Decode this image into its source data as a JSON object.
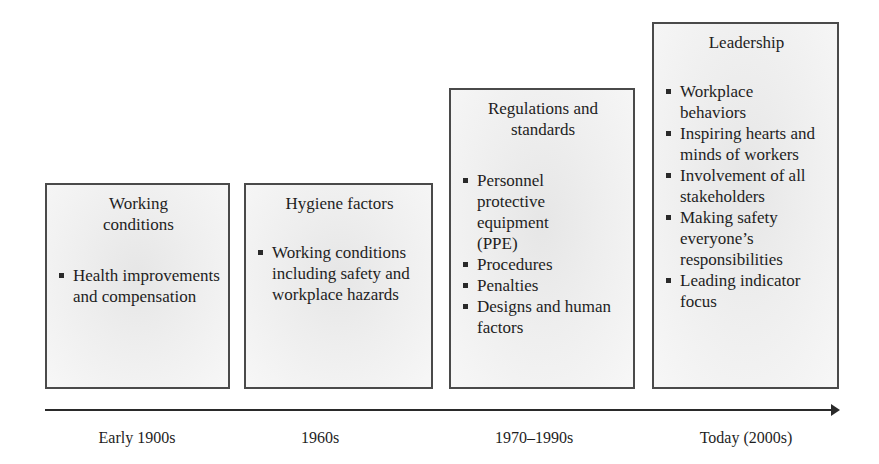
{
  "stages": [
    {
      "title": "Working conditions",
      "items": [
        "Health improvements and compensation"
      ],
      "era": "Early 1900s"
    },
    {
      "title": "Hygiene factors",
      "items": [
        "Working conditions including safety and workplace hazards"
      ],
      "era": "1960s"
    },
    {
      "title": "Regulations and standards",
      "items": [
        "Personnel protective equipment (PPE)",
        "Procedures",
        "Penalties",
        "Designs and human factors"
      ],
      "era": "1970–1990s"
    },
    {
      "title": "Leadership",
      "items": [
        "Workplace behaviors",
        "Inspiring hearts and minds of workers",
        "Involvement of all stakeholders",
        "Making safety everyone’s responsibilities",
        "Leading indicator focus"
      ],
      "era": "Today (2000s)"
    }
  ],
  "colors": {
    "border": "#4a4a4a",
    "box_fill": "#eeeeee",
    "axis": "#2a2a2a"
  }
}
